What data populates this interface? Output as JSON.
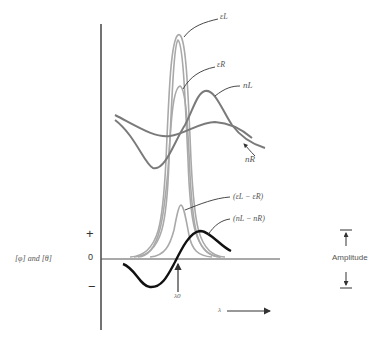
{
  "diagram": {
    "type": "optical dispersion / absorption curves",
    "y_axis": {
      "label": "[φ]  and  [θ]",
      "plus_label": "+",
      "zero_label": "0",
      "minus_label": "−"
    },
    "x_axis": {
      "label": "λ",
      "arrow": "right"
    },
    "curves": [
      {
        "name": "εL",
        "label": "εL",
        "color": "#a9a9a9",
        "description": "tall absorption band"
      },
      {
        "name": "εR",
        "label": "εR",
        "color": "#a9a9a9",
        "description": "shorter absorption band"
      },
      {
        "name": "nL",
        "label": "nL",
        "color": "#808080",
        "description": "refractive index curve L"
      },
      {
        "name": "nR",
        "label": "nR",
        "color": "#808080",
        "description": "refractive index curve R"
      },
      {
        "name": "eps_diff",
        "label": "(εL − εR)",
        "color": "#a9a9a9",
        "description": "circular dichroism band"
      },
      {
        "name": "n_diff",
        "label": "(nL − nR)",
        "color": "#111111",
        "description": "circular birefringence (ORD) curve"
      }
    ],
    "marker": {
      "label": "λ0",
      "description": "center wavelength arrow"
    },
    "amplitude": {
      "label": "Amplitude"
    }
  },
  "labels": {
    "epsL": "εL",
    "epsR": "εR",
    "nL": "nL",
    "nR": "nR",
    "epsDiff": "(εL − εR)",
    "nDiff": "(nL − nR)",
    "lambda0": "λ0",
    "lambda": "λ",
    "yLabel": "[φ]  and  [θ]",
    "plus": "+",
    "zero": "0",
    "minus": "−",
    "amplitude": "Amplitude"
  }
}
